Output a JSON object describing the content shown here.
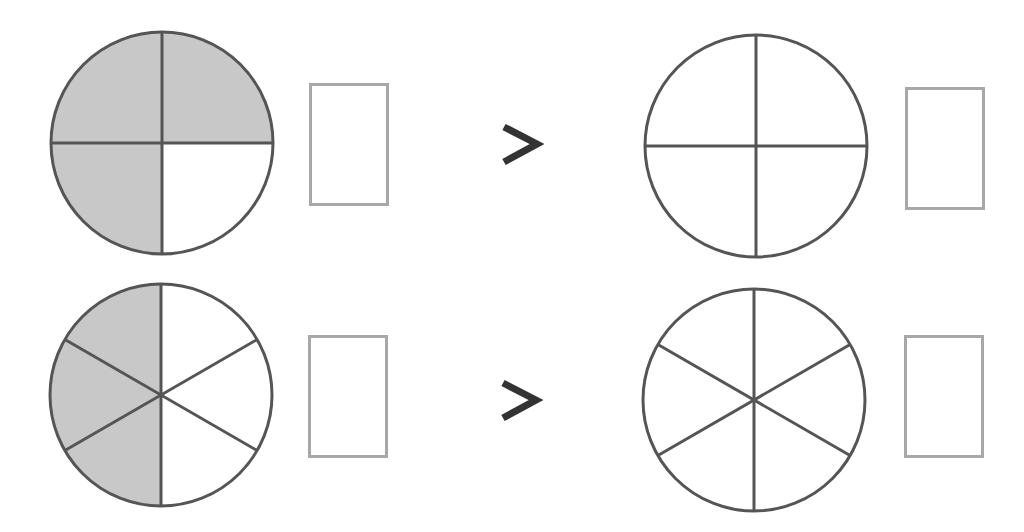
{
  "colors": {
    "stroke": "#555555",
    "shaded": "#c8c8c8",
    "unshaded": "#ffffff",
    "box_border": "#a8a8a8",
    "symbol": "#333333"
  },
  "rows": [
    {
      "left_circle": {
        "parts": 4,
        "shaded": 3
      },
      "comparison": ">",
      "right_circle": {
        "parts": 4,
        "shaded": 0
      },
      "left_box_value": "",
      "right_box_value": ""
    },
    {
      "left_circle": {
        "parts": 6,
        "shaded": 3
      },
      "comparison": ">",
      "right_circle": {
        "parts": 6,
        "shaded": 0
      },
      "left_box_value": "",
      "right_box_value": ""
    }
  ]
}
